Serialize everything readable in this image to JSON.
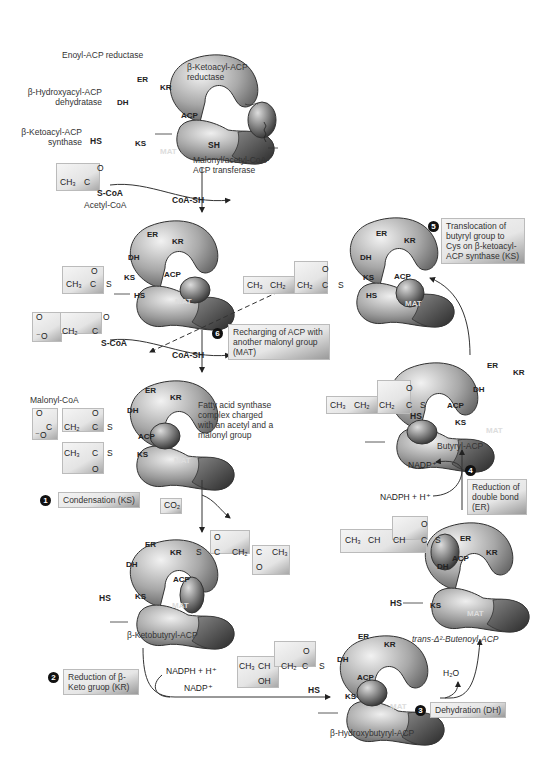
{
  "diagram": {
    "domain_labels": {
      "er": "Enoyl-ACP reductase",
      "kr": "β-Ketoacyl-ACP reductase",
      "dh": "β-Hydroxyacyl-ACP dehydratase",
      "ks": "β-Ketoacyl-ACP synthase",
      "mat": "Malonyl/acetyl-CoA-ACP transferase"
    },
    "domains": {
      "er": "ER",
      "kr": "KR",
      "dh": "DH",
      "ks": "KS",
      "mat": "MAT",
      "acp": "ACP",
      "hs": "HS",
      "sh": "SH",
      "s": "S"
    },
    "molecules": {
      "acetyl_coa": "Acetyl-CoA",
      "malonyl_coa": "Malonyl-CoA",
      "coa_sh": "CoA-SH",
      "s_coa": "S-CoA",
      "co2": "CO₂",
      "nadph": "NADPH + H⁺",
      "nadp": "NADP⁺",
      "h2o": "H₂O",
      "ch3": "CH₃",
      "ch2": "CH₂",
      "ch": "CH",
      "c": "C",
      "o": "O",
      "o_minus": "⁻O",
      "oh": "OH"
    },
    "intermediates": {
      "ketobutyryl": "β-Ketobutyryl-ACP",
      "hydroxybutyryl": "β-Hydroxybutyryl-ACP",
      "butenoyl": "trans-Δ²-Butenoyl-ACP",
      "butyryl": "Butyryl-ACP"
    },
    "charged_note": "Fatty acid synthase complex charged with an acetyl and a malonyl group",
    "steps": [
      {
        "num": "1",
        "label": "Condensation (KS)"
      },
      {
        "num": "2",
        "label": "Reduction of β-Keto gruop (KR)"
      },
      {
        "num": "3",
        "label": "Dehydration (DH)"
      },
      {
        "num": "4",
        "label": "Reduction of double bond (ER)"
      },
      {
        "num": "5",
        "label": "Translocation of butyryl group to Cys on β-ketoacyl-ACP synthase (KS)"
      },
      {
        "num": "6",
        "label": "Recharging of ACP with another malonyl group (MAT)"
      }
    ]
  }
}
